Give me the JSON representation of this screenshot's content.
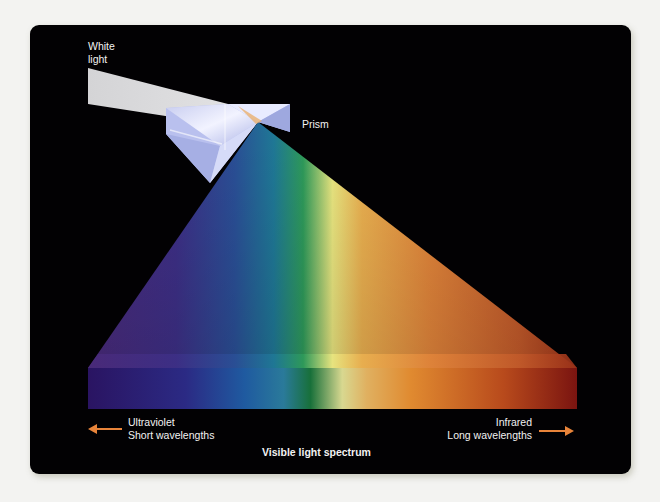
{
  "diagram": {
    "title": "Visible light spectrum",
    "labels": {
      "white_light_line1": "White",
      "white_light_line2": "light",
      "prism": "Prism",
      "left_line1": "Ultraviolet",
      "left_line2": "Short wavelengths",
      "right_line1": "Infrared",
      "right_line2": "Long wavelengths",
      "caption": "Visible light spectrum"
    },
    "arrows": [
      {
        "direction": "left",
        "color": "#e8843a"
      },
      {
        "direction": "right",
        "color": "#e8843a"
      }
    ],
    "spectrum_colors": [
      "#3a1f6e",
      "#2e2a8a",
      "#1f5a9a",
      "#1e7f9a",
      "#1f8a3a",
      "#e8e07a",
      "#e7a03a",
      "#e07a28",
      "#b8401e",
      "#8a1a12"
    ],
    "background": "#020103"
  }
}
